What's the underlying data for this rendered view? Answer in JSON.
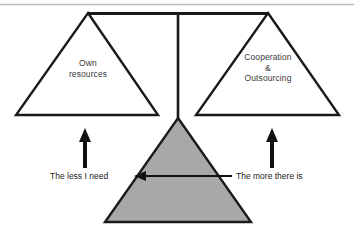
{
  "diagram": {
    "top_rule": {
      "name": "top-divider-rule",
      "color": "#bdbdbd"
    },
    "colors": {
      "stroke": "#1a1a1a",
      "pyramid_fill": "#a8a8a8",
      "pan_fill": "#ffffff",
      "text": "#2b2b2b",
      "top_rule": "#bdbdbd",
      "background": "#ffffff"
    },
    "beam": {
      "name": "balance-beam",
      "left_x": 88,
      "right_x": 268,
      "y": 13,
      "post_x": 178,
      "post_bottom_y": 118
    },
    "left_pan": {
      "name": "left-pan-triangle",
      "label": "Own\nresources",
      "apex": [
        88,
        13
      ],
      "base_left": [
        16,
        115
      ],
      "base_right": [
        158,
        115
      ],
      "fill": "#ffffff"
    },
    "right_pan": {
      "name": "right-pan-triangle",
      "label": "Cooperation\n&\nOutsourcing",
      "apex": [
        268,
        13
      ],
      "base_left": [
        196,
        115
      ],
      "base_right": [
        339,
        115
      ],
      "fill": "#ffffff"
    },
    "fulcrum_pyramid": {
      "name": "fulcrum-pyramid",
      "apex": [
        178,
        118
      ],
      "base_left": [
        105,
        222
      ],
      "base_right": [
        251,
        222
      ],
      "fill": "#a8a8a8"
    },
    "horizontal_arrow": {
      "name": "leftward-arrow",
      "from_x": 232,
      "to_x": 136,
      "y": 176,
      "direction": "left"
    },
    "left_arrow_up": {
      "name": "left-up-arrow",
      "x": 85,
      "tail_y": 168,
      "head_y": 129
    },
    "right_arrow_up": {
      "name": "right-up-arrow",
      "x": 272,
      "tail_y": 168,
      "head_y": 129
    },
    "labels": {
      "less_i_need": "The less I need",
      "more_there_is": "The more there is"
    }
  }
}
